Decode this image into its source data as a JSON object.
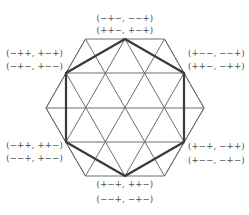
{
  "diagram": {
    "colors": {
      "grid_line": "#6e6e6e",
      "bold_line": "#3a3a3a",
      "label_text": "#4a4a4a",
      "background": "#ffffff"
    },
    "labels": {
      "top": {
        "line1": "(−+−, −−+)",
        "line2": "(++−, +−+)"
      },
      "upper_left": {
        "line1": "(−++, +−+)",
        "line2": "(−+−, +−−)"
      },
      "upper_right": {
        "line1": "(+−−, −−+)",
        "line2": "(++−, −++)"
      },
      "lower_left": {
        "line1": "(−++, ++−)",
        "line2": "(−−+, +−−)"
      },
      "lower_right": {
        "line1": "(+−+, −++)",
        "line2": "(+−−, −+−)"
      },
      "bottom": {
        "line1": "(+−+, ++−)",
        "line2": "(−−+, −+−)"
      }
    }
  }
}
